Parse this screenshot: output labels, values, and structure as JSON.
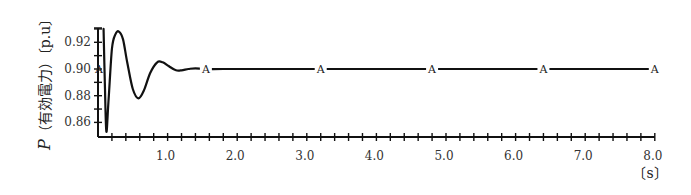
{
  "chart_data": {
    "type": "line",
    "title": "",
    "xlabel": "〔s〕",
    "ylabel": "P（有効電力）〔p.u〕",
    "ylabel_parts": {
      "symbol": "P",
      "name": "（有効電力）",
      "unit": "〔p.u〕"
    },
    "xlim": [
      0,
      8.0
    ],
    "ylim": [
      0.85,
      0.93
    ],
    "grid": false,
    "x_ticks": [
      1.0,
      2.0,
      3.0,
      4.0,
      5.0,
      6.0,
      7.0,
      8.0
    ],
    "x_tick_labels": [
      "1.0",
      "2.0",
      "3.0",
      "4.0",
      "5.0",
      "6.0",
      "7.0",
      "8.0"
    ],
    "x_minor_step": 0.2,
    "y_ticks": [
      0.86,
      0.88,
      0.9,
      0.92
    ],
    "y_tick_labels": [
      "0.86",
      "0.88",
      "0.90",
      "0.92"
    ],
    "y_minor_step": 0.01,
    "series": [
      {
        "name": "P",
        "color": "#111111",
        "x": [
          0.08,
          0.1,
          0.12,
          0.15,
          0.2,
          0.25,
          0.3,
          0.36,
          0.42,
          0.5,
          0.58,
          0.66,
          0.75,
          0.85,
          0.93,
          1.02,
          1.12,
          1.2,
          1.3,
          1.4,
          1.55,
          1.8,
          2.5,
          3.2,
          4.0,
          4.8,
          5.6,
          6.4,
          7.2,
          8.0
        ],
        "values": [
          0.93,
          0.885,
          0.853,
          0.875,
          0.915,
          0.926,
          0.928,
          0.922,
          0.905,
          0.885,
          0.878,
          0.884,
          0.897,
          0.905,
          0.905,
          0.902,
          0.899,
          0.899,
          0.9,
          0.9005,
          0.9,
          0.9,
          0.9,
          0.9,
          0.9,
          0.9,
          0.9,
          0.9,
          0.9,
          0.9
        ]
      }
    ],
    "annotations": [
      {
        "text": "A",
        "x": 0.0,
        "y": 0.9
      },
      {
        "text": "A",
        "x": 1.55,
        "y": 0.9
      },
      {
        "text": "A",
        "x": 3.2,
        "y": 0.9
      },
      {
        "text": "A",
        "x": 4.8,
        "y": 0.9
      },
      {
        "text": "A",
        "x": 6.4,
        "y": 0.9
      },
      {
        "text": "A",
        "x": 8.0,
        "y": 0.9
      }
    ],
    "legend": null
  }
}
